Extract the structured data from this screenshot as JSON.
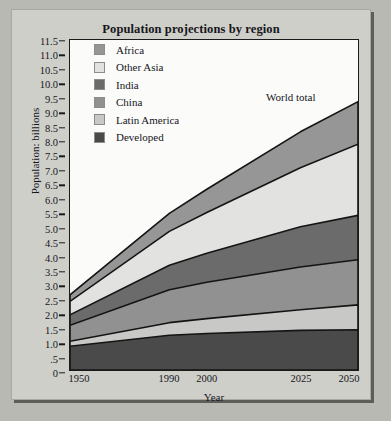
{
  "panel": {
    "title": "Population projections by region"
  },
  "annotations": {
    "world_total": "World total"
  },
  "colors": {
    "africa": "#969696",
    "other_asia": "#e2e2e0",
    "india": "#6b6b6b",
    "china": "#919191",
    "latin_america": "#c8c8c6",
    "developed": "#4a4a4a",
    "plot_background": "#fbfbfa",
    "panel_background": "#cfcfca",
    "page_background": "#b9b9b4",
    "axis": "#1a1a1a",
    "text": "#15151a"
  },
  "legend": {
    "position": "inside-top-left",
    "items": [
      {
        "label": "Africa",
        "color": "#969696"
      },
      {
        "label": "Other Asia",
        "color": "#e2e2e0"
      },
      {
        "label": "India",
        "color": "#6b6b6b"
      },
      {
        "label": "China",
        "color": "#919191"
      },
      {
        "label": "Latin America",
        "color": "#c8c8c6"
      },
      {
        "label": "Developed",
        "color": "#4a4a4a"
      }
    ]
  },
  "chart_data": {
    "type": "area",
    "title": "Population projections by region",
    "xlabel": "Year",
    "ylabel": "Population: billions",
    "x": [
      1950,
      1990,
      2000,
      2025,
      2050
    ],
    "xtick_labels": [
      "1950",
      "1990",
      "2000",
      "2025",
      "2050"
    ],
    "ylim": [
      0,
      11.5
    ],
    "ytick_values": [
      0,
      0.5,
      1.0,
      1.5,
      2.0,
      2.5,
      3.0,
      3.5,
      4.0,
      4.5,
      5.0,
      5.5,
      6.0,
      6.5,
      7.0,
      7.5,
      8.0,
      8.5,
      9.0,
      9.5,
      10.0,
      10.5,
      11.0,
      11.5
    ],
    "ytick_labels": [
      "0",
      ".5",
      "1.0",
      "1.5",
      "2.0",
      "2.5",
      "3.0",
      "3.5",
      "4.0",
      "4.5",
      "5.0",
      "5.5",
      "6.0",
      "6.5",
      "7.0",
      "7.5",
      "8.0",
      "8.5",
      "9.0",
      "9.5",
      "10.0",
      "10.5",
      "11.0",
      "11.5"
    ],
    "grid": false,
    "stacked": true,
    "stack_order_bottom_to_top": [
      "Developed",
      "Latin America",
      "China",
      "India",
      "Other Asia",
      "Africa"
    ],
    "series": [
      {
        "name": "Developed",
        "color": "#4a4a4a",
        "values": [
          0.83,
          1.21,
          1.27,
          1.38,
          1.4
        ]
      },
      {
        "name": "Latin America",
        "color": "#c8c8c6",
        "values": [
          0.17,
          0.44,
          0.52,
          0.72,
          0.87
        ]
      },
      {
        "name": "China",
        "color": "#919191",
        "values": [
          0.56,
          1.15,
          1.27,
          1.49,
          1.57
        ]
      },
      {
        "name": "India",
        "color": "#6b6b6b",
        "values": [
          0.36,
          0.85,
          1.01,
          1.4,
          1.55
        ]
      },
      {
        "name": "Other Asia",
        "color": "#e2e2e0",
        "values": [
          0.47,
          1.18,
          1.42,
          2.06,
          2.48
        ]
      },
      {
        "name": "Africa",
        "color": "#969696",
        "values": [
          0.23,
          0.63,
          0.81,
          1.25,
          1.48
        ]
      }
    ],
    "cumulative_tops": {
      "Developed": [
        0.83,
        1.21,
        1.27,
        1.38,
        1.4
      ],
      "Latin America": [
        1.0,
        1.65,
        1.79,
        2.1,
        2.27
      ],
      "China": [
        1.56,
        2.8,
        3.06,
        3.59,
        3.84
      ],
      "India": [
        1.92,
        3.65,
        4.07,
        4.99,
        5.39
      ],
      "Other Asia": [
        2.39,
        4.83,
        5.49,
        7.05,
        7.87
      ],
      "Africa": [
        2.62,
        5.46,
        6.3,
        8.3,
        9.35
      ]
    },
    "world_total": [
      2.62,
      5.46,
      6.3,
      8.3,
      9.35
    ],
    "annotations": [
      {
        "text": "World total",
        "x": 2025,
        "y": 10.1
      }
    ]
  }
}
